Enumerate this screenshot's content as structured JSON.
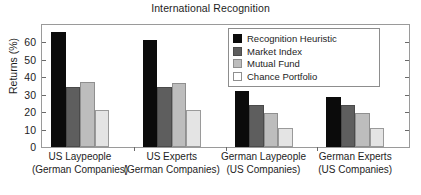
{
  "chart_data": {
    "type": "bar",
    "title": "International Recognition",
    "xlabel": "",
    "ylabel": "Returns (%)",
    "ylim": [
      0,
      70
    ],
    "yticks": [
      0,
      10,
      20,
      30,
      40,
      50,
      60
    ],
    "grid": false,
    "legend_position": "top-right",
    "categories": [
      "US Laypeople (German Companies)",
      "US Experts (German Companies)",
      "German Laypeople (US Companies)",
      "German Experts (US Companies)"
    ],
    "category_lines": [
      {
        "line1": "US Laypeople",
        "line2": "(German Companies)"
      },
      {
        "line1": "US Experts",
        "line2": "(German Companies)"
      },
      {
        "line1": "German Laypeople",
        "line2": "(US Companies)"
      },
      {
        "line1": "German  Experts",
        "line2": "(US Companies)"
      }
    ],
    "series": [
      {
        "name": "Recognition Heuristic",
        "color": "#0b0b0b",
        "values": [
          66.0,
          61.5,
          32.0,
          28.5
        ]
      },
      {
        "name": "Market Index",
        "color": "#5e5e5e",
        "values": [
          34.5,
          34.5,
          24.0,
          24.0
        ]
      },
      {
        "name": "Mutual Fund",
        "color": "#bdbdbd",
        "values": [
          37.5,
          37.0,
          19.5,
          19.5
        ]
      },
      {
        "name": "Chance Portfolio",
        "color": "#e4e4e4",
        "values": [
          21.5,
          21.0,
          11.0,
          11.0
        ]
      }
    ]
  },
  "axis": {
    "ytick_labels": [
      "0",
      "10",
      "20",
      "30",
      "40",
      "50",
      "60"
    ]
  },
  "legend": {
    "items": [
      {
        "label": "Recognition Heuristic"
      },
      {
        "label": "Market Index"
      },
      {
        "label": "Mutual Fund"
      },
      {
        "label": "Chance Portfolio"
      }
    ]
  }
}
